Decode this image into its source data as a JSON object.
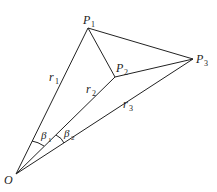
{
  "diagram": {
    "points": {
      "O": {
        "label": "O",
        "x": 16,
        "y": 174
      },
      "P1": {
        "label": "P",
        "sub": "1",
        "x": 88,
        "y": 28
      },
      "P2": {
        "label": "P",
        "sub": "2",
        "x": 115,
        "y": 77
      },
      "P3": {
        "label": "P",
        "sub": "3",
        "x": 193,
        "y": 59
      }
    },
    "segments": [
      {
        "from": "O",
        "to": "P1",
        "label": "r",
        "sub": "1"
      },
      {
        "from": "O",
        "to": "P2",
        "label": "r",
        "sub": "2"
      },
      {
        "from": "O",
        "to": "P3",
        "label": "r",
        "sub": "3"
      },
      {
        "from": "P1",
        "to": "P2"
      },
      {
        "from": "P2",
        "to": "P3"
      },
      {
        "from": "P1",
        "to": "P3"
      }
    ],
    "angles": [
      {
        "label": "β",
        "sub": "1",
        "between": [
          "r1",
          "r2"
        ]
      },
      {
        "label": "β",
        "sub": "2",
        "between": [
          "r2",
          "r3"
        ]
      }
    ],
    "labels": {
      "O": "O",
      "P": "P",
      "r": "r",
      "beta": "β",
      "s1": "1",
      "s2": "2",
      "s3": "3"
    },
    "stroke_color": "#222222"
  }
}
